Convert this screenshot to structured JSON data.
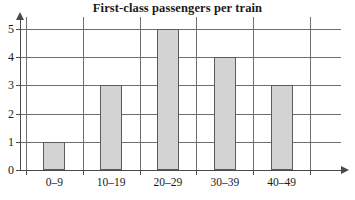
{
  "chart_data": {
    "type": "bar",
    "title": "First-class passengers per train",
    "xlabel": "",
    "ylabel": "",
    "categories": [
      "0–9",
      "10–19",
      "20–29",
      "30–39",
      "40–49"
    ],
    "values": [
      1,
      3,
      5,
      4,
      3
    ],
    "ylim": [
      0,
      5
    ],
    "yticks": [
      "0",
      "1",
      "2",
      "3",
      "4",
      "5"
    ],
    "grid": true,
    "legend": false,
    "bar_fill_color": "#d3d3d3",
    "bar_edge_color": "#5c5c5c",
    "grid_color": "#6e6e6e",
    "axis_color": "#4a4a4a",
    "background_color": "#ffffff"
  }
}
